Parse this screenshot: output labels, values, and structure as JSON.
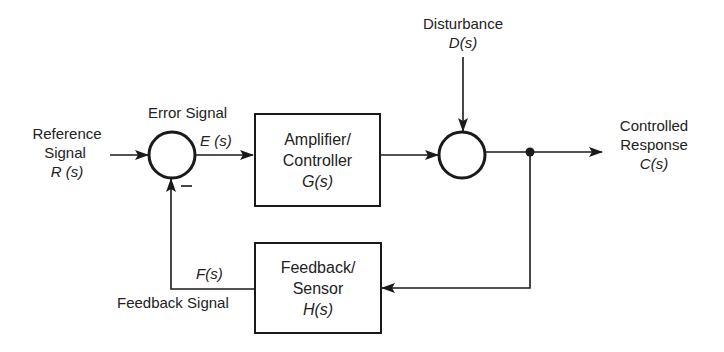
{
  "diagram": {
    "type": "feedback-control-block-diagram",
    "inputs": {
      "reference": {
        "line1": "Reference",
        "line2": "Signal",
        "symbol": "R (s)"
      },
      "disturbance": {
        "line1": "Disturbance",
        "symbol": "D(s)"
      }
    },
    "error": {
      "label": "Error Signal",
      "symbol": "E (s)"
    },
    "summing_junction_1": {
      "sign_feedback": "—"
    },
    "controller_block": {
      "line1": "Amplifier/",
      "line2": "Controller",
      "symbol": "G(s)"
    },
    "output": {
      "line1": "Controlled",
      "line2": "Response",
      "symbol": "C(s)"
    },
    "feedback_block": {
      "line1": "Feedback/",
      "line2": "Sensor",
      "symbol": "H(s)"
    },
    "feedback_signal": {
      "symbol": "F(s)",
      "label": "Feedback Signal"
    },
    "edges": [
      {
        "from": "R(s)",
        "to": "summing_junction_1"
      },
      {
        "from": "summing_junction_1",
        "to": "controller_block",
        "signal": "E(s)"
      },
      {
        "from": "controller_block",
        "to": "summing_junction_2"
      },
      {
        "from": "D(s)",
        "to": "summing_junction_2"
      },
      {
        "from": "summing_junction_2",
        "to": "C(s)"
      },
      {
        "from": "pickoff_point",
        "to": "feedback_block"
      },
      {
        "from": "feedback_block",
        "to": "summing_junction_1",
        "signal": "F(s)",
        "sign": "-"
      }
    ],
    "colors": {
      "line": "#1a1a1a",
      "background": "#ffffff"
    }
  }
}
